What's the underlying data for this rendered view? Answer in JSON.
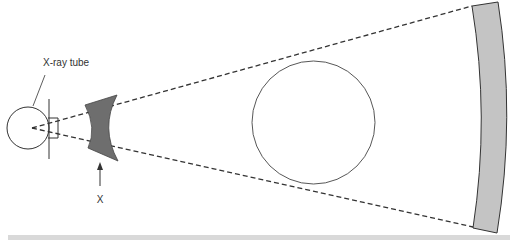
{
  "diagram": {
    "labels": {
      "tube": "X-ray tube",
      "filter": "X"
    },
    "colors": {
      "stroke": "#333333",
      "filter_fill": "#6e6e6e",
      "detector_fill": "#c4c4c4",
      "footer_band": "#d9d9d9",
      "background": "#ffffff"
    },
    "components": [
      {
        "name": "x-ray-tube",
        "shape": "circle"
      },
      {
        "name": "bow-tie-filter",
        "shape": "concave polygon",
        "label": "X"
      },
      {
        "name": "beam-boundary",
        "shape": "dashed lines"
      },
      {
        "name": "patient-object",
        "shape": "circle"
      },
      {
        "name": "detector-arc",
        "shape": "curved band"
      }
    ]
  }
}
